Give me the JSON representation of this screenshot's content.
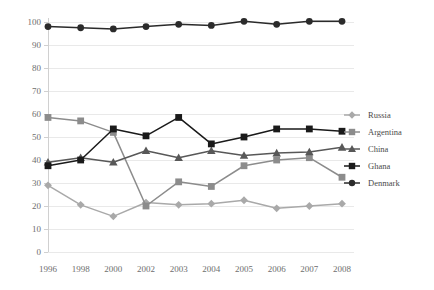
{
  "chart_data": {
    "type": "line",
    "title": "",
    "subtitle": "",
    "xlabel": "",
    "ylabel": "",
    "categories": [
      "1996",
      "1998",
      "2000",
      "2002",
      "2003",
      "2004",
      "2005",
      "2006",
      "2007",
      "2008"
    ],
    "ylim": [
      0,
      100
    ],
    "yticks": [
      0,
      10,
      20,
      30,
      40,
      50,
      60,
      70,
      80,
      90,
      100
    ],
    "ytick_labels": [
      "0",
      "10",
      "20",
      "30",
      "40",
      "50",
      "60",
      "70",
      "80",
      "90",
      "100"
    ],
    "grid": true,
    "grid_axis": "y",
    "legend_position": "right",
    "series": [
      {
        "name": "Russia",
        "color": "#a9a9a9",
        "marker": "diamond",
        "values": [
          29,
          20.5,
          15.5,
          21.5,
          20.5,
          21,
          22.5,
          19,
          20,
          21
        ]
      },
      {
        "name": "Argentina",
        "color": "#8c8c8c",
        "marker": "square",
        "values": [
          58.5,
          57,
          52,
          20,
          30.5,
          28.5,
          37.5,
          40,
          41,
          32.5
        ]
      },
      {
        "name": "China",
        "color": "#585858",
        "marker": "triangle",
        "values": [
          39,
          41,
          39,
          44,
          41,
          44,
          42,
          43,
          43.5,
          45.5
        ]
      },
      {
        "name": "Ghana",
        "color": "#1a1a1a",
        "marker": "square",
        "values": [
          37.5,
          40,
          53.5,
          50.5,
          58.5,
          47,
          50,
          53.5,
          53.5,
          52.5
        ]
      },
      {
        "name": "Denmark",
        "color": "#2b2b2b",
        "marker": "circle",
        "values": [
          98,
          97.5,
          97,
          98,
          99,
          98.5,
          100.3,
          99,
          100.3,
          100.3
        ]
      }
    ]
  },
  "legend": {
    "items": [
      {
        "label": "Russia"
      },
      {
        "label": "Argentina"
      },
      {
        "label": "China"
      },
      {
        "label": "Ghana"
      },
      {
        "label": "Denmark"
      }
    ]
  }
}
